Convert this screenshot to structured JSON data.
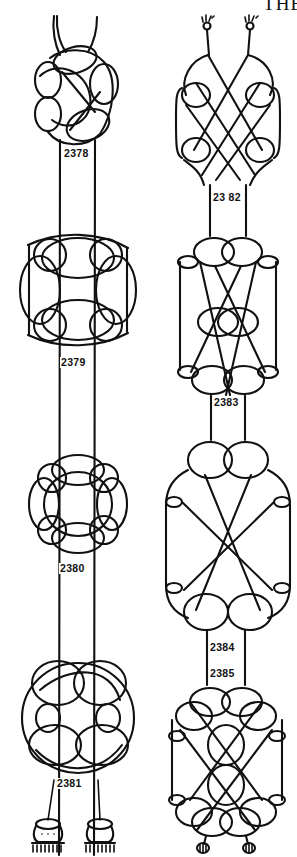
{
  "page": {
    "running_head": "THE",
    "background": "#ffffff",
    "ink": "#111111"
  },
  "columns": [
    {
      "name": "left-column",
      "knots": [
        {
          "number": "2378",
          "shape": "compact-rosette-with-hanging-loop"
        },
        {
          "number": "2379",
          "shape": "octagonal-rosette"
        },
        {
          "number": "2380",
          "shape": "small-rosette"
        },
        {
          "number": "2381",
          "shape": "large-rosette-with-tassels"
        }
      ],
      "end_finish": "two-tassels"
    },
    {
      "name": "right-column",
      "knots": [
        {
          "number": "2382",
          "shape": "oval-lattice-with-crowned-ends"
        },
        {
          "number": "2383",
          "shape": "tall-lattice-with-center-loop"
        },
        {
          "number": "2384",
          "shape": "diamond-lattice"
        },
        {
          "number": "2385",
          "shape": "double-lattice-with-ring-ends"
        }
      ],
      "top_finish": "two-crown-knot-ends",
      "end_finish": "two-ring-ends"
    }
  ],
  "labels": {
    "k2378": "2378",
    "k2379": "2379",
    "k2380": "2380",
    "k2381": "2381",
    "k2382": "23 82",
    "k2383": "2383",
    "k2384": "2384",
    "k2385": "2385"
  }
}
